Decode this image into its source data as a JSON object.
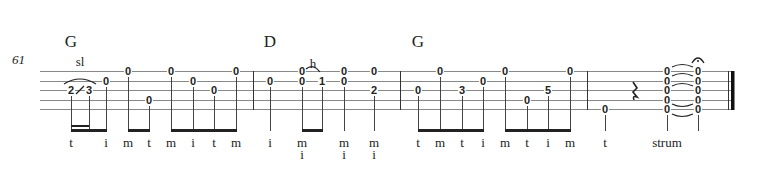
{
  "measure_number": "61",
  "chords": [
    {
      "label": "G",
      "x": 71
    },
    {
      "label": "D",
      "x": 270
    },
    {
      "label": "G",
      "x": 418
    }
  ],
  "techniques": [
    {
      "label": "sl",
      "x": 80,
      "y": 55
    },
    {
      "label": "h",
      "x": 313,
      "y": 57
    }
  ],
  "strings_y": [
    71,
    81,
    90,
    100,
    109
  ],
  "barlines_x": [
    253,
    400,
    587
  ],
  "notes": [
    {
      "fret": "2",
      "x": 71,
      "string": 3
    },
    {
      "fret": "3",
      "x": 89,
      "string": 3
    },
    {
      "fret": "0",
      "x": 106,
      "string": 2
    },
    {
      "fret": "0",
      "x": 128,
      "string": 1
    },
    {
      "fret": "0",
      "x": 149,
      "string": 4
    },
    {
      "fret": "0",
      "x": 171,
      "string": 1
    },
    {
      "fret": "0",
      "x": 193,
      "string": 2
    },
    {
      "fret": "0",
      "x": 214,
      "string": 3
    },
    {
      "fret": "0",
      "x": 236,
      "string": 1
    },
    {
      "fret": "0",
      "x": 270,
      "string": 2
    },
    {
      "fret": "0",
      "x": 302,
      "string": 1
    },
    {
      "fret": "0",
      "x": 302,
      "string": 2
    },
    {
      "fret": "1",
      "x": 322,
      "string": 2
    },
    {
      "fret": "0",
      "x": 344,
      "string": 1
    },
    {
      "fret": "0",
      "x": 344,
      "string": 2
    },
    {
      "fret": "0",
      "x": 374,
      "string": 1
    },
    {
      "fret": "2",
      "x": 374,
      "string": 3
    },
    {
      "fret": "0",
      "x": 418,
      "string": 3
    },
    {
      "fret": "0",
      "x": 440,
      "string": 1
    },
    {
      "fret": "3",
      "x": 462,
      "string": 3
    },
    {
      "fret": "0",
      "x": 483,
      "string": 2
    },
    {
      "fret": "0",
      "x": 505,
      "string": 1
    },
    {
      "fret": "0",
      "x": 527,
      "string": 4
    },
    {
      "fret": "5",
      "x": 548,
      "string": 3
    },
    {
      "fret": "0",
      "x": 570,
      "string": 1
    },
    {
      "fret": "0",
      "x": 605,
      "string": 5
    },
    {
      "fret": "0",
      "x": 667,
      "string": 1
    },
    {
      "fret": "0",
      "x": 667,
      "string": 2
    },
    {
      "fret": "0",
      "x": 667,
      "string": 3
    },
    {
      "fret": "0",
      "x": 667,
      "string": 4
    },
    {
      "fret": "0",
      "x": 667,
      "string": 5
    },
    {
      "fret": "0",
      "x": 698,
      "string": 1
    },
    {
      "fret": "0",
      "x": 698,
      "string": 2
    },
    {
      "fret": "0",
      "x": 698,
      "string": 3
    },
    {
      "fret": "0",
      "x": 698,
      "string": 4
    },
    {
      "fret": "0",
      "x": 698,
      "string": 5
    }
  ],
  "fingerings": [
    {
      "x": 71,
      "top": "t"
    },
    {
      "x": 106,
      "top": "i"
    },
    {
      "x": 128,
      "top": "m"
    },
    {
      "x": 149,
      "top": "t"
    },
    {
      "x": 171,
      "top": "m"
    },
    {
      "x": 193,
      "top": "i"
    },
    {
      "x": 214,
      "top": "t"
    },
    {
      "x": 236,
      "top": "m"
    },
    {
      "x": 270,
      "top": "i"
    },
    {
      "x": 302,
      "top": "m",
      "bottom": "i"
    },
    {
      "x": 344,
      "top": "m",
      "bottom": "i"
    },
    {
      "x": 374,
      "top": "m",
      "bottom": "i"
    },
    {
      "x": 418,
      "top": "t"
    },
    {
      "x": 440,
      "top": "m"
    },
    {
      "x": 462,
      "top": "t"
    },
    {
      "x": 483,
      "top": "i"
    },
    {
      "x": 505,
      "top": "m"
    },
    {
      "x": 527,
      "top": "t"
    },
    {
      "x": 548,
      "top": "i"
    },
    {
      "x": 570,
      "top": "m"
    },
    {
      "x": 605,
      "top": "t"
    },
    {
      "x": 667,
      "top": "strum"
    }
  ],
  "rest_x": 635,
  "fermata_x": 698
}
